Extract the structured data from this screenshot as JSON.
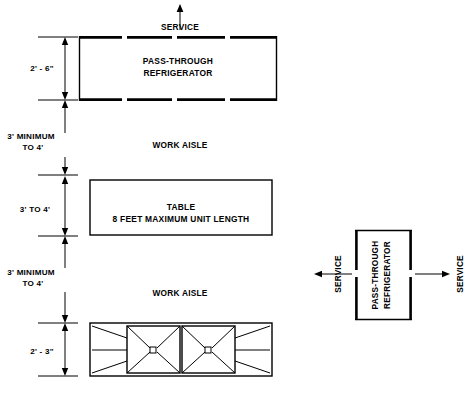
{
  "diagram": {
    "units": "feet and inches",
    "line_color": "#000000",
    "background_color": "#ffffff"
  },
  "top": {
    "service_label": "SERVICE"
  },
  "refrigerator_top": {
    "line1": "PASS-THROUGH",
    "line2": "REFRIGERATOR",
    "dimension": "2' - 6\""
  },
  "aisle_upper": {
    "label": "WORK  AISLE",
    "dimension_line1": "3'  MINIMUM",
    "dimension_line2": "TO  4'"
  },
  "table": {
    "line1": "TABLE",
    "line2": "8 FEET MAXIMUM UNIT LENGTH",
    "dimension": "3'  TO  4'"
  },
  "aisle_lower": {
    "label": "WORK  AISLE",
    "dimension_line1": "3'  MINIMUM",
    "dimension_line2": "TO  4'"
  },
  "range": {
    "dimension": "2' - 3\"",
    "burner_count": 2
  },
  "side_elevation": {
    "line1": "PASS-THROUGH",
    "line2": "REFRIGERATOR",
    "service_left": "SERVICE",
    "service_right": "SERVICE"
  },
  "dimension_labels": [
    "2' - 6\"",
    "3'  MINIMUM",
    "TO  4'",
    "3'  TO  4'",
    "3'  MINIMUM",
    "TO  4'",
    "2' - 3\""
  ]
}
